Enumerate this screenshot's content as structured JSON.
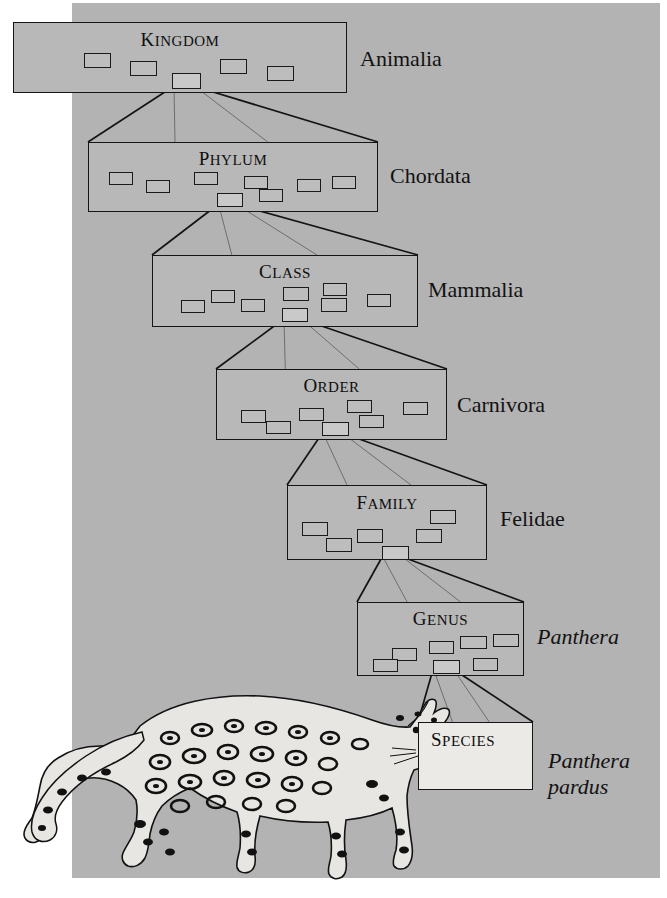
{
  "figure": {
    "kind": "taxonomic-hierarchy-diagram",
    "background_color": "#b3b3b3",
    "page_color": "#ffffff",
    "box_fill": "#b8b8b8",
    "species_box_fill": "#eceae6",
    "line_color": "#151515"
  },
  "ranks": [
    {
      "id": "kingdom",
      "title": "KINGDOM",
      "title_first": "K",
      "title_rest": "INGDOM",
      "taxon": "Animalia",
      "taxon_italic": false,
      "box": {
        "x": 13,
        "y": 22,
        "w": 334,
        "h": 71
      },
      "title_y": 6,
      "label": {
        "x": 360,
        "y": 46
      },
      "members": [
        {
          "x": 70,
          "y": 30,
          "w": 27,
          "h": 15,
          "selected": false
        },
        {
          "x": 116,
          "y": 38,
          "w": 27,
          "h": 15,
          "selected": false
        },
        {
          "x": 206,
          "y": 36,
          "w": 27,
          "h": 15,
          "selected": false
        },
        {
          "x": 253,
          "y": 43,
          "w": 27,
          "h": 15,
          "selected": false
        },
        {
          "x": 158,
          "y": 50,
          "w": 29,
          "h": 16,
          "selected": true
        }
      ]
    },
    {
      "id": "phylum",
      "title": "PHYLUM",
      "title_first": "P",
      "title_rest": "HYLUM",
      "taxon": "Chordata",
      "taxon_italic": false,
      "box": {
        "x": 88,
        "y": 142,
        "w": 290,
        "h": 70
      },
      "title_y": 5,
      "label": {
        "x": 390,
        "y": 163
      },
      "members": [
        {
          "x": 20,
          "y": 29,
          "w": 24,
          "h": 13,
          "selected": false
        },
        {
          "x": 57,
          "y": 37,
          "w": 24,
          "h": 13,
          "selected": false
        },
        {
          "x": 105,
          "y": 29,
          "w": 24,
          "h": 13,
          "selected": false
        },
        {
          "x": 155,
          "y": 33,
          "w": 24,
          "h": 13,
          "selected": false
        },
        {
          "x": 208,
          "y": 36,
          "w": 24,
          "h": 13,
          "selected": false
        },
        {
          "x": 243,
          "y": 33,
          "w": 24,
          "h": 13,
          "selected": false
        },
        {
          "x": 170,
          "y": 46,
          "w": 24,
          "h": 13,
          "selected": false
        },
        {
          "x": 128,
          "y": 50,
          "w": 26,
          "h": 14,
          "selected": true
        }
      ]
    },
    {
      "id": "class",
      "title": "CLASS",
      "title_first": "C",
      "title_rest": "LASS",
      "taxon": "Mammalia",
      "taxon_italic": false,
      "box": {
        "x": 152,
        "y": 255,
        "w": 266,
        "h": 72
      },
      "title_y": 5,
      "label": {
        "x": 428,
        "y": 277
      },
      "members": [
        {
          "x": 28,
          "y": 44,
          "w": 24,
          "h": 13,
          "selected": false
        },
        {
          "x": 58,
          "y": 34,
          "w": 24,
          "h": 13,
          "selected": false
        },
        {
          "x": 88,
          "y": 43,
          "w": 24,
          "h": 13,
          "selected": false
        },
        {
          "x": 130,
          "y": 31,
          "w": 26,
          "h": 14,
          "selected": false
        },
        {
          "x": 170,
          "y": 27,
          "w": 24,
          "h": 13,
          "selected": false
        },
        {
          "x": 168,
          "y": 42,
          "w": 26,
          "h": 14,
          "selected": false
        },
        {
          "x": 214,
          "y": 38,
          "w": 24,
          "h": 13,
          "selected": false
        },
        {
          "x": 129,
          "y": 52,
          "w": 26,
          "h": 14,
          "selected": true
        }
      ]
    },
    {
      "id": "order",
      "title": "ORDER",
      "title_first": "O",
      "title_rest": "RDER",
      "taxon": "Carnivora",
      "taxon_italic": false,
      "box": {
        "x": 216,
        "y": 369,
        "w": 231,
        "h": 71
      },
      "title_y": 5,
      "label": {
        "x": 457,
        "y": 392
      },
      "members": [
        {
          "x": 24,
          "y": 40,
          "w": 25,
          "h": 13,
          "selected": false
        },
        {
          "x": 49,
          "y": 51,
          "w": 25,
          "h": 13,
          "selected": false
        },
        {
          "x": 82,
          "y": 38,
          "w": 25,
          "h": 13,
          "selected": false
        },
        {
          "x": 130,
          "y": 30,
          "w": 25,
          "h": 13,
          "selected": false
        },
        {
          "x": 142,
          "y": 45,
          "w": 25,
          "h": 13,
          "selected": false
        },
        {
          "x": 186,
          "y": 32,
          "w": 25,
          "h": 13,
          "selected": false
        },
        {
          "x": 105,
          "y": 52,
          "w": 27,
          "h": 14,
          "selected": true
        }
      ]
    },
    {
      "id": "family",
      "title": "FAMILY",
      "title_first": "F",
      "title_rest": "AMILY",
      "taxon": "Felidae",
      "taxon_italic": false,
      "box": {
        "x": 287,
        "y": 485,
        "w": 200,
        "h": 75
      },
      "title_y": 6,
      "label": {
        "x": 500,
        "y": 506
      },
      "members": [
        {
          "x": 14,
          "y": 36,
          "w": 26,
          "h": 14,
          "selected": false
        },
        {
          "x": 38,
          "y": 52,
          "w": 26,
          "h": 14,
          "selected": false
        },
        {
          "x": 69,
          "y": 43,
          "w": 26,
          "h": 14,
          "selected": false
        },
        {
          "x": 128,
          "y": 43,
          "w": 26,
          "h": 14,
          "selected": false
        },
        {
          "x": 142,
          "y": 24,
          "w": 26,
          "h": 14,
          "selected": false
        },
        {
          "x": 94,
          "y": 60,
          "w": 27,
          "h": 14,
          "selected": true
        }
      ]
    },
    {
      "id": "genus",
      "title": "GENUS",
      "title_first": "G",
      "title_rest": "ENUS",
      "taxon": "Panthera",
      "taxon_italic": true,
      "box": {
        "x": 357,
        "y": 602,
        "w": 167,
        "h": 74
      },
      "title_y": 5,
      "label": {
        "x": 537,
        "y": 624
      },
      "members": [
        {
          "x": 34,
          "y": 45,
          "w": 25,
          "h": 13,
          "selected": false
        },
        {
          "x": 71,
          "y": 38,
          "w": 25,
          "h": 13,
          "selected": false
        },
        {
          "x": 102,
          "y": 33,
          "w": 27,
          "h": 13,
          "selected": false
        },
        {
          "x": 135,
          "y": 31,
          "w": 26,
          "h": 13,
          "selected": false
        },
        {
          "x": 15,
          "y": 56,
          "w": 25,
          "h": 13,
          "selected": false
        },
        {
          "x": 115,
          "y": 55,
          "w": 25,
          "h": 13,
          "selected": false
        },
        {
          "x": 75,
          "y": 57,
          "w": 27,
          "h": 14,
          "selected": true
        }
      ]
    },
    {
      "id": "species",
      "title": "SPECIES",
      "title_first": "S",
      "title_rest": "PECIES",
      "taxon": "Panthera pardus",
      "taxon_line1": "Panthera",
      "taxon_line2": "pardus",
      "taxon_italic": true,
      "box": {
        "x": 418,
        "y": 722,
        "w": 115,
        "h": 68
      },
      "title_y": 6,
      "label": {
        "x": 548,
        "y": 748
      },
      "members": []
    }
  ],
  "connectors": [
    {
      "from": "kingdom",
      "to": "phylum"
    },
    {
      "from": "phylum",
      "to": "class"
    },
    {
      "from": "class",
      "to": "order"
    },
    {
      "from": "order",
      "to": "family"
    },
    {
      "from": "family",
      "to": "genus"
    },
    {
      "from": "genus",
      "to": "species"
    }
  ],
  "illustration": {
    "name": "leopard-illustration",
    "caption": "Panthera pardus"
  }
}
